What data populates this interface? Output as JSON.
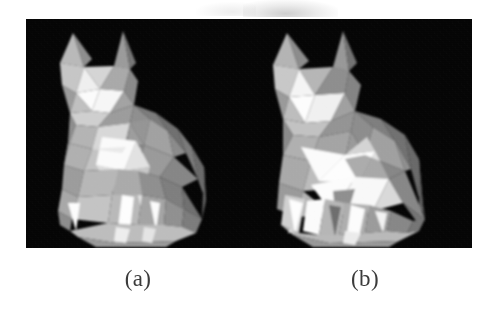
{
  "figure": {
    "name": "two-panel-cat-render-figure",
    "background_color": "#ffffff",
    "plate_color": "#050505",
    "caption_color": "#3b3b3b",
    "panels": [
      {
        "id": "a",
        "label": "(a)",
        "subject": "low-poly cat statue",
        "description": "Flat-shaded faceted cat model, seated pose, facing left, many small triangles, softer mid-gray shading",
        "facet_count_impression": "high",
        "background": "black"
      },
      {
        "id": "b",
        "label": "(b)",
        "subject": "low-poly cat statue",
        "description": "Flat-shaded faceted cat model, seated pose, facing left, fewer and larger triangles, higher contrast between bright white and mid-gray faces",
        "facet_count_impression": "low",
        "background": "black"
      }
    ]
  },
  "captions": {
    "a": "(a)",
    "b": "(b)"
  },
  "palette": {
    "page_white": "#ffffff",
    "plate_black": "#050505",
    "highlight_white": "#fdfdfd",
    "light_gray": "#dcdcdc",
    "mid_gray": "#b2b2b2",
    "dim_gray": "#8d8d8d",
    "dark_gray": "#6a6a6a",
    "shadow_gray": "#474747",
    "caption_ink": "#3b3b3b"
  }
}
